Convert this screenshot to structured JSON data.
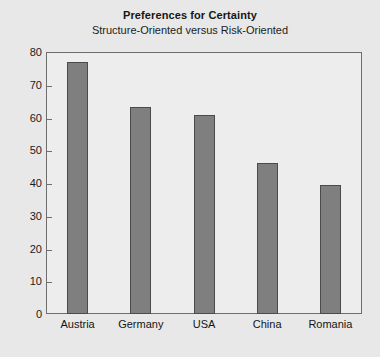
{
  "chart_data": {
    "type": "bar",
    "title": "Preferences for Certainty",
    "subtitle": "Structure-Oriented versus Risk-Oriented",
    "categories": [
      "Austria",
      "Germany",
      "USA",
      "China",
      "Romania"
    ],
    "values": [
      77.0,
      63.3,
      60.8,
      46.2,
      39.3
    ],
    "xlabel": "",
    "ylabel": "",
    "ylim": [
      0,
      80
    ],
    "ytick_labels": [
      "80",
      "70",
      "60",
      "50",
      "40",
      "30",
      "20",
      "10",
      "0"
    ],
    "ytick_values": [
      80,
      70,
      60,
      50,
      40,
      30,
      20,
      10,
      0
    ],
    "grid": false,
    "legend": "none",
    "bar_color": "#7f7f7f",
    "bar_edge_color": "#4a4a4a",
    "plot_background": "#ededed",
    "page_background": "#e8e8e8",
    "frame_color": "#6e6e6e"
  }
}
